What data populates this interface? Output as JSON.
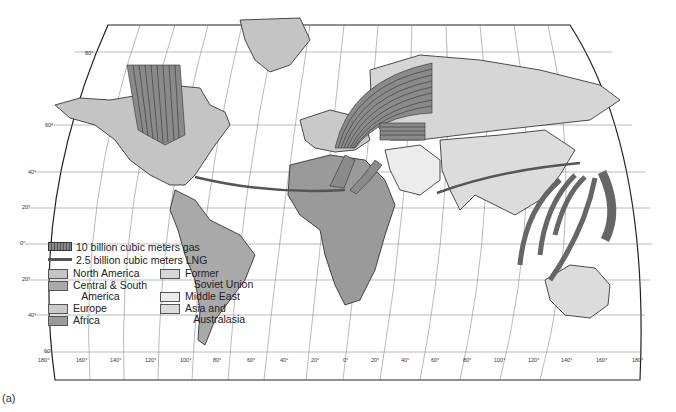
{
  "figure": {
    "caption": "(a)",
    "type": "world map of natural gas trade flows"
  },
  "legend": {
    "gas_pipeline_label": "10 billion cubic meters gas",
    "lng_label": "2.5 billion cubic meters LNG",
    "regions": [
      {
        "label": "North America",
        "color": "#c4c4c4"
      },
      {
        "label": "Central & South\n   America",
        "color": "#a9a9a9"
      },
      {
        "label": "Europe",
        "color": "#c9c9c9"
      },
      {
        "label": "Africa",
        "color": "#9a9a9a"
      },
      {
        "label": "Former\n   Soviet Union",
        "color": "#d6d6d6"
      },
      {
        "label": "Middle East",
        "color": "#ececec"
      },
      {
        "label": "Asia and\n   Australasia",
        "color": "#dcdcdc"
      }
    ]
  },
  "axes": {
    "latitude_labels": [
      "80°",
      "60°",
      "40°",
      "20°",
      "0°",
      "20°",
      "40°",
      "60°"
    ],
    "longitude_labels": [
      "180°",
      "160°",
      "140°",
      "120°",
      "100°",
      "80°",
      "60°",
      "40°",
      "20°",
      "0°",
      "20°",
      "40°",
      "60°",
      "80°",
      "100°",
      "120°",
      "140°",
      "160°",
      "180°"
    ]
  },
  "colors": {
    "flow_band": "#8a8a8a",
    "flow_line": "#444444",
    "ocean": "#ffffff",
    "graticule": "#555555"
  },
  "flows": [
    {
      "from": "Canada",
      "to": "United States",
      "kind": "pipeline",
      "bands": 9
    },
    {
      "from": "Former Soviet Union",
      "to": "Europe",
      "kind": "pipeline",
      "bands": 9
    },
    {
      "from": "Former Soviet Union",
      "to": "Europe (central)",
      "kind": "pipeline",
      "bands": 4
    },
    {
      "from": "Algeria",
      "to": "Europe",
      "kind": "pipeline/LNG",
      "bands": 7
    },
    {
      "from": "Algeria",
      "to": "United States",
      "kind": "LNG",
      "bands": 1
    },
    {
      "from": "Middle East",
      "to": "Japan",
      "kind": "LNG",
      "bands": 1
    },
    {
      "from": "Southeast Asia",
      "to": "Japan/Korea",
      "kind": "LNG",
      "bands": 5
    },
    {
      "from": "Australia",
      "to": "Japan",
      "kind": "LNG",
      "bands": 3
    }
  ]
}
